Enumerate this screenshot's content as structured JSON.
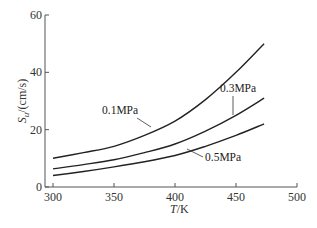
{
  "chart_data": {
    "type": "line",
    "title": "",
    "xlabel": "T/K",
    "ylabel": "S_u/(cm/s)",
    "xlim": [
      300,
      500
    ],
    "ylim": [
      0,
      60
    ],
    "xticks": [
      300,
      350,
      400,
      450,
      500
    ],
    "yticks": [
      0,
      20,
      40,
      60
    ],
    "grid": false,
    "legend": "inline labels",
    "x": [
      300,
      325,
      350,
      375,
      400,
      425,
      450,
      473
    ],
    "series": [
      {
        "name": "0.1MPa",
        "values": [
          10,
          12,
          14.2,
          18,
          23,
          30.5,
          40,
          50
        ]
      },
      {
        "name": "0.3MPa",
        "values": [
          6.3,
          7.8,
          9.5,
          12,
          15,
          19.5,
          25,
          31
        ]
      },
      {
        "name": "0.5MPa",
        "values": [
          4,
          5.4,
          7,
          8.8,
          11,
          14.2,
          18,
          22
        ]
      }
    ]
  },
  "labels": {
    "xaxis_title_italic": "T",
    "xaxis_title_unit": "/K",
    "yaxis_title_main": "S",
    "yaxis_title_sub": "u",
    "yaxis_title_unit": "/(cm/s)",
    "curve_01": "0.1MPa",
    "curve_03": "0.3MPa",
    "curve_05": "0.5MPa"
  },
  "colors": {
    "line": "#222222",
    "axis": "#555555"
  }
}
